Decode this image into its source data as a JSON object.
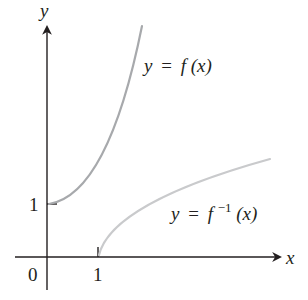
{
  "diagram": {
    "type": "function-and-inverse-graph",
    "axes": {
      "x_label": "x",
      "y_label": "y",
      "origin_label": "0",
      "x_tick_label": "1",
      "y_tick_label": "1"
    },
    "curves": [
      {
        "name": "f",
        "label_lhs": "y",
        "label_eq": "=",
        "label_fn": "f",
        "label_arg": "(x)",
        "color": "#a7a9ac",
        "start_point": [
          0,
          1
        ]
      },
      {
        "name": "f-inverse",
        "label_lhs": "y",
        "label_eq": "=",
        "label_fn": "f",
        "label_sup": "−1",
        "label_arg": "(x)",
        "color": "#c9cacc",
        "start_point": [
          1,
          0
        ]
      }
    ],
    "colors": {
      "axis": "#231f20",
      "text": "#231f20"
    }
  }
}
